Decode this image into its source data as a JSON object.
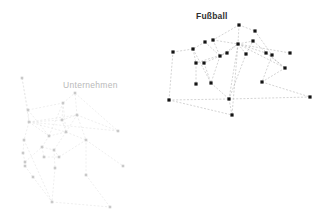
{
  "figure": {
    "background": "#ffffff",
    "width": 331,
    "height": 222
  },
  "chart_data": {
    "type": "scatter",
    "title": "",
    "xlabel": "",
    "ylabel": "",
    "grid": false,
    "legend_position": "none",
    "axis_visible": false,
    "xlim": [
      0,
      331
    ],
    "ylim": [
      0,
      222
    ],
    "clusters": [
      {
        "id": "fussball",
        "label": "Fußball",
        "label_color": "#2f2f2f",
        "label_weight": "bold",
        "label_x": 196,
        "label_y": 17,
        "node_color": "#141414",
        "edge_color": "#a8a8a8",
        "node_size": 3.2,
        "node_count": 20,
        "edge_count": 34,
        "nodes": [
          {
            "id": "f1",
            "x": 239,
            "y": 25
          },
          {
            "id": "f2",
            "x": 255,
            "y": 31
          },
          {
            "id": "f3",
            "x": 272,
            "y": 55
          },
          {
            "id": "f4",
            "x": 213,
            "y": 40
          },
          {
            "id": "f5",
            "x": 220,
            "y": 56
          },
          {
            "id": "f6",
            "x": 238,
            "y": 44
          },
          {
            "id": "f7",
            "x": 246,
            "y": 54
          },
          {
            "id": "f8",
            "x": 205,
            "y": 42
          },
          {
            "id": "f9",
            "x": 227,
            "y": 53
          },
          {
            "id": "f10",
            "x": 266,
            "y": 53
          },
          {
            "id": "f11",
            "x": 290,
            "y": 53
          },
          {
            "id": "f12",
            "x": 285,
            "y": 68
          },
          {
            "id": "f13",
            "x": 253,
            "y": 41
          },
          {
            "id": "f14",
            "x": 193,
            "y": 49
          },
          {
            "id": "f15",
            "x": 173,
            "y": 52
          },
          {
            "id": "f16",
            "x": 196,
            "y": 63
          },
          {
            "id": "f17",
            "x": 204,
            "y": 63
          },
          {
            "id": "f18",
            "x": 196,
            "y": 84
          },
          {
            "id": "f19",
            "x": 211,
            "y": 83
          },
          {
            "id": "f20",
            "x": 262,
            "y": 82
          },
          {
            "id": "f21",
            "x": 229,
            "y": 99
          },
          {
            "id": "f22",
            "x": 169,
            "y": 100
          },
          {
            "id": "f23",
            "x": 232,
            "y": 115
          },
          {
            "id": "f24",
            "x": 310,
            "y": 97
          }
        ],
        "edges": [
          [
            "f1",
            "f4"
          ],
          [
            "f1",
            "f2"
          ],
          [
            "f1",
            "f6"
          ],
          [
            "f2",
            "f3"
          ],
          [
            "f4",
            "f5"
          ],
          [
            "f4",
            "f6"
          ],
          [
            "f5",
            "f6"
          ],
          [
            "f6",
            "f7"
          ],
          [
            "f6",
            "f9"
          ],
          [
            "f6",
            "f13"
          ],
          [
            "f6",
            "f10"
          ],
          [
            "f6",
            "f11"
          ],
          [
            "f6",
            "f12"
          ],
          [
            "f6",
            "f21"
          ],
          [
            "f6",
            "f23"
          ],
          [
            "f7",
            "f13"
          ],
          [
            "f9",
            "f16"
          ],
          [
            "f9",
            "f17"
          ],
          [
            "f13",
            "f12"
          ],
          [
            "f10",
            "f12"
          ],
          [
            "f3",
            "f20"
          ],
          [
            "f12",
            "f20"
          ],
          [
            "f20",
            "f24"
          ],
          [
            "f21",
            "f24"
          ],
          [
            "f22",
            "f15"
          ],
          [
            "f22",
            "f21"
          ],
          [
            "f22",
            "f23"
          ],
          [
            "f15",
            "f14"
          ],
          [
            "f14",
            "f16"
          ],
          [
            "f14",
            "f19"
          ],
          [
            "f16",
            "f18"
          ],
          [
            "f19",
            "f21"
          ],
          [
            "f21",
            "f23"
          ],
          [
            "f5",
            "f19"
          ],
          [
            "f8",
            "f5"
          ],
          [
            "f8",
            "f14"
          ],
          [
            "f7",
            "f21"
          ],
          [
            "f17",
            "f19"
          ]
        ]
      },
      {
        "id": "unternehmen",
        "label": "Unternehmen",
        "label_color": "#b9b9b9",
        "label_weight": "normal",
        "label_x": 63,
        "label_y": 86,
        "node_color": "#c9c9c9",
        "edge_color": "#dcdcdc",
        "node_size": 2.6,
        "node_count": 24,
        "edge_count": 40,
        "nodes": [
          {
            "id": "u1",
            "x": 22,
            "y": 78
          },
          {
            "id": "u2",
            "x": 29,
            "y": 122
          },
          {
            "id": "u3",
            "x": 24,
            "y": 140
          },
          {
            "id": "u4",
            "x": 23,
            "y": 153
          },
          {
            "id": "u5",
            "x": 25,
            "y": 162
          },
          {
            "id": "u6",
            "x": 25,
            "y": 166
          },
          {
            "id": "u7",
            "x": 33,
            "y": 177
          },
          {
            "id": "u8",
            "x": 28,
            "y": 110
          },
          {
            "id": "u9",
            "x": 42,
            "y": 147
          },
          {
            "id": "u10",
            "x": 49,
            "y": 136
          },
          {
            "id": "u11",
            "x": 44,
            "y": 157
          },
          {
            "id": "u12",
            "x": 54,
            "y": 150
          },
          {
            "id": "u13",
            "x": 63,
            "y": 103
          },
          {
            "id": "u14",
            "x": 55,
            "y": 168
          },
          {
            "id": "u15",
            "x": 66,
            "y": 132
          },
          {
            "id": "u16",
            "x": 62,
            "y": 120
          },
          {
            "id": "u17",
            "x": 77,
            "y": 115
          },
          {
            "id": "u18",
            "x": 75,
            "y": 93
          },
          {
            "id": "u19",
            "x": 59,
            "y": 157
          },
          {
            "id": "u20",
            "x": 86,
            "y": 140
          },
          {
            "id": "u21",
            "x": 118,
            "y": 131
          },
          {
            "id": "u22",
            "x": 123,
            "y": 166
          },
          {
            "id": "u23",
            "x": 52,
            "y": 202
          },
          {
            "id": "u24",
            "x": 110,
            "y": 207
          },
          {
            "id": "u25",
            "x": 86,
            "y": 175
          }
        ],
        "edges": [
          [
            "u1",
            "u2"
          ],
          [
            "u1",
            "u8"
          ],
          [
            "u8",
            "u2"
          ],
          [
            "u8",
            "u10"
          ],
          [
            "u2",
            "u3"
          ],
          [
            "u3",
            "u4"
          ],
          [
            "u4",
            "u5"
          ],
          [
            "u5",
            "u6"
          ],
          [
            "u6",
            "u7"
          ],
          [
            "u2",
            "u10"
          ],
          [
            "u2",
            "u15"
          ],
          [
            "u2",
            "u16"
          ],
          [
            "u2",
            "u17"
          ],
          [
            "u2",
            "u21"
          ],
          [
            "u10",
            "u15"
          ],
          [
            "u10",
            "u13"
          ],
          [
            "u13",
            "u15"
          ],
          [
            "u13",
            "u18"
          ],
          [
            "u15",
            "u16"
          ],
          [
            "u15",
            "u17"
          ],
          [
            "u15",
            "u12"
          ],
          [
            "u16",
            "u17"
          ],
          [
            "u17",
            "u18"
          ],
          [
            "u17",
            "u21"
          ],
          [
            "u18",
            "u21"
          ],
          [
            "u9",
            "u10"
          ],
          [
            "u9",
            "u11"
          ],
          [
            "u9",
            "u12"
          ],
          [
            "u12",
            "u19"
          ],
          [
            "u12",
            "u14"
          ],
          [
            "u19",
            "u20"
          ],
          [
            "u20",
            "u22"
          ],
          [
            "u15",
            "u20"
          ],
          [
            "u3",
            "u23"
          ],
          [
            "u7",
            "u23"
          ],
          [
            "u23",
            "u24"
          ],
          [
            "u24",
            "u25"
          ],
          [
            "u25",
            "u20"
          ],
          [
            "u14",
            "u23"
          ],
          [
            "u11",
            "u19"
          ],
          [
            "u16",
            "u13"
          ],
          [
            "u17",
            "u20"
          ],
          [
            "u8",
            "u13"
          ],
          [
            "u5",
            "u9"
          ]
        ]
      }
    ]
  }
}
